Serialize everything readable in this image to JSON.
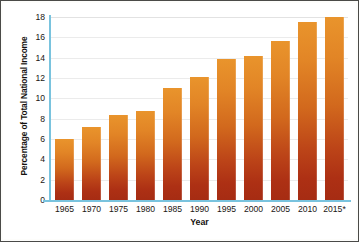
{
  "chart_data": {
    "type": "bar",
    "title": "",
    "subtitle": "",
    "xlabel": "Year",
    "ylabel": "Percentage of Total National Income",
    "categories": [
      "1965",
      "1970",
      "1975",
      "1980",
      "1985",
      "1990",
      "1995",
      "2000",
      "2005",
      "2010",
      "2015*"
    ],
    "values": [
      6.0,
      7.2,
      8.4,
      8.8,
      11.0,
      12.1,
      13.9,
      14.2,
      15.6,
      17.5,
      18.0
    ],
    "ylim": [
      0,
      18
    ],
    "ytick_step": 2,
    "yticks": [
      "0",
      "2",
      "4",
      "6",
      "8",
      "10",
      "12",
      "14",
      "16",
      "18"
    ],
    "xlim_categories": 11,
    "grid": "horizontal",
    "legend": "none",
    "annotations": [
      "* 2015 value is marked with an asterisk"
    ],
    "colors": {
      "bar_top": "#E9942C",
      "bar_bottom": "#A62C13",
      "axis_line": "#79C3DE",
      "gridline": "#EBEBEB",
      "text": "#1B1713",
      "frame": "#4A4A48",
      "background": "#FFFFFF"
    }
  }
}
